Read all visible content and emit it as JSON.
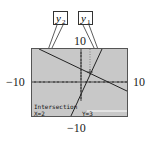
{
  "diagram": {
    "type": "graphing-calculator-screen",
    "window": {
      "xmin": -10,
      "xmax": 10,
      "ymin": -10,
      "ymax": 10
    },
    "axis_labels": {
      "top": "10",
      "bottom": "−10",
      "left": "−10",
      "right": "10"
    },
    "callouts": [
      {
        "id": "y2",
        "label": "y",
        "sub": "2"
      },
      {
        "id": "y1",
        "label": "y",
        "sub": "1"
      }
    ],
    "screen": {
      "status_title": "Intersection",
      "x_readout": "X=2",
      "y_readout": "Y=3"
    },
    "lines": [
      {
        "name": "y1",
        "description": "steep increasing line",
        "passes_through": [
          [
            2,
            3
          ]
        ]
      },
      {
        "name": "y2",
        "description": "decreasing line",
        "passes_through": [
          [
            2,
            3
          ]
        ]
      }
    ],
    "intersection": {
      "x": 2,
      "y": 3
    },
    "colors": {
      "screen_bg": "#c8c8c8",
      "line": "#222222",
      "frame": "#555555"
    }
  }
}
